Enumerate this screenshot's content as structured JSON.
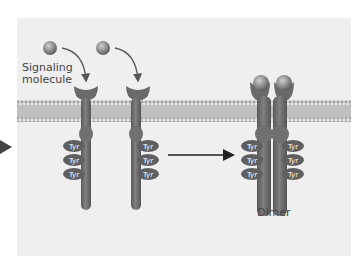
{
  "figure": {
    "type": "receptor-tyrosine-kinase-dimerization",
    "labels": {
      "signaling_molecule_line1": "Signaling",
      "signaling_molecule_line2": "molecule",
      "dimer": "Dimer",
      "tyr": "Tyr"
    },
    "receptors_left": [
      {
        "tyr_count": 3,
        "tyr_side": "left"
      },
      {
        "tyr_count": 3,
        "tyr_side": "right"
      }
    ],
    "dimer_tyr": {
      "left": 3,
      "right": 3
    },
    "colors": {
      "panel_bg": "#efefef",
      "membrane": "#b9b9b9",
      "membrane_head": "#9a9a9a",
      "receptor": "#6f6f6f",
      "tyr_fill": "#5f5f5f",
      "tyr_text": "#ffffff",
      "ligand": "#8e8e8e",
      "arrow": "#222222",
      "pointer": "#555555"
    }
  }
}
